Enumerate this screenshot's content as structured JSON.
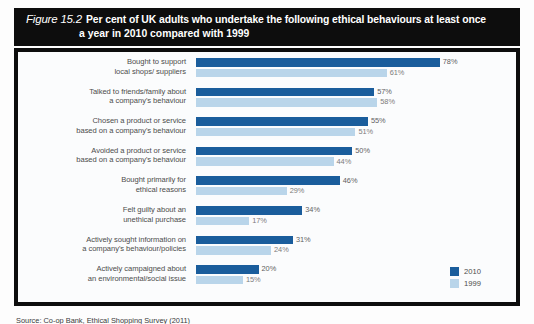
{
  "figure": {
    "number": "Figure 15.2",
    "title_line1": "Per cent of UK adults who undertake the following ethical behaviours at least once",
    "title_line2": "a year in 2010 compared with 1999",
    "source": "Source: Co-op Bank, Ethical Shopping Survey (2011)"
  },
  "legend": {
    "items": [
      {
        "label": "2010",
        "color": "#1a5d9c"
      },
      {
        "label": "1999",
        "color": "#b9d5ea"
      }
    ]
  },
  "colors": {
    "series_2010": "#1a5d9c",
    "series_1999": "#b9d5ea",
    "banner": "#0d0d0d",
    "panel": "#fbfcfd",
    "label_text": "#4c4c4c"
  },
  "chart_data": {
    "type": "bar",
    "orientation": "horizontal",
    "title": "Per cent of UK adults who undertake the following ethical behaviours at least once a year in 2010 compared with 1999",
    "xlabel": "",
    "ylabel": "",
    "xlim": [
      0,
      80
    ],
    "grid": false,
    "legend_position": "bottom-right",
    "value_suffix": "%",
    "categories": [
      "Bought to support local shops/ suppliers",
      "Talked to friends/family about a company's behaviour",
      "Chosen a product or service based on a company's behaviour",
      "Avoided a product or service based on a company's behaviour",
      "Bought primarily for ethical reasons",
      "Felt guilty about an unethical purchase",
      "Actively sought information on a company's behaviour/policies",
      "Actively campaigned about an environmental/social issue"
    ],
    "category_lines": [
      [
        "Bought to support",
        "local shops/ suppliers"
      ],
      [
        "Talked to friends/family about",
        "a company's behaviour"
      ],
      [
        "Chosen a product or service",
        "based on a company's behaviour"
      ],
      [
        "Avoided a product or service",
        "based on a company's behaviour"
      ],
      [
        "Bought primarily for",
        "ethical reasons"
      ],
      [
        "Felt guilty about an",
        "unethical purchase"
      ],
      [
        "Actively sought information on",
        "a company's behaviour/policies"
      ],
      [
        "Actively campaigned about",
        "an environmental/social issue"
      ]
    ],
    "series": [
      {
        "name": "2010",
        "values": [
          78,
          57,
          55,
          50,
          46,
          34,
          31,
          20
        ]
      },
      {
        "name": "1999",
        "values": [
          61,
          58,
          51,
          44,
          29,
          17,
          24,
          15
        ]
      }
    ],
    "value_labels": {
      "2010": [
        "78%",
        "57%",
        "55%",
        "50%",
        "46%",
        "34%",
        "31%",
        "20%"
      ],
      "1999": [
        "61%",
        "58%",
        "51%",
        "44%",
        "29%",
        "17%",
        "24%",
        "15%"
      ]
    }
  }
}
